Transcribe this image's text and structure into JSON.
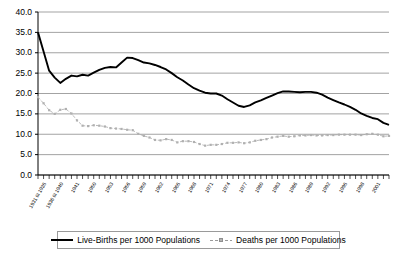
{
  "chart_data": {
    "type": "line",
    "title": "",
    "xlabel": "",
    "ylabel": "",
    "ylim": [
      0.0,
      40.0
    ],
    "ytick_labels": [
      "0.0",
      "5.0",
      "10.0",
      "15.0",
      "20.0",
      "25.0",
      "30.0",
      "35.0",
      "40.0"
    ],
    "ytick_values": [
      0,
      5,
      10,
      15,
      20,
      25,
      30,
      35,
      40
    ],
    "grid": true,
    "legend_position": "bottom",
    "categories": [
      "1931 til 1935",
      "1936 til 1940",
      "1941",
      "1942",
      "1943",
      "1944",
      "1945",
      "1946",
      "1947",
      "1948",
      "1949",
      "1950",
      "1951",
      "1952",
      "1953",
      "1954",
      "1955",
      "1956",
      "1957",
      "1958",
      "1959",
      "1960",
      "1961",
      "1962",
      "1963",
      "1964",
      "1965",
      "1966",
      "1967",
      "1968",
      "1969",
      "1970",
      "1971",
      "1972",
      "1973",
      "1974",
      "1975",
      "1976",
      "1977",
      "1978",
      "1979",
      "1980",
      "1981",
      "1982",
      "1983",
      "1984",
      "1985",
      "1986",
      "1987",
      "1988",
      "1989",
      "1990",
      "1991",
      "1992",
      "1993",
      "1994",
      "1995",
      "1996",
      "1997",
      "1998",
      "1999",
      "2000",
      "2001",
      "2002"
    ],
    "xtick_labels_shown": [
      "1931 til 1935",
      "1936 til 1940",
      "1941",
      "1950",
      "1953",
      "1956",
      "1959",
      "1962",
      "1965",
      "1968",
      "1971",
      "1974",
      "1977",
      "1980",
      "1983",
      "1986",
      "1989",
      "1992",
      "1995",
      "1998",
      "2001"
    ],
    "series": [
      {
        "name": "Live-Births per 1000 Populations",
        "color": "#000000",
        "style": "solid",
        "values": [
          35.0,
          30.3,
          25.6,
          23.9,
          22.6,
          23.6,
          24.4,
          24.2,
          24.6,
          24.4,
          25.1,
          25.8,
          26.3,
          26.5,
          26.4,
          27.6,
          28.8,
          28.7,
          28.2,
          27.6,
          27.4,
          27.0,
          26.5,
          25.9,
          25.0,
          24.0,
          23.2,
          22.2,
          21.3,
          20.7,
          20.2,
          20.0,
          20.0,
          19.5,
          18.6,
          17.8,
          17.0,
          16.7,
          17.1,
          17.8,
          18.3,
          18.9,
          19.5,
          20.1,
          20.5,
          20.5,
          20.4,
          20.3,
          20.4,
          20.4,
          20.2,
          19.7,
          19.0,
          18.4,
          17.8,
          17.3,
          16.7,
          16.0,
          15.1,
          14.5,
          14.0,
          13.7,
          12.8,
          12.3
        ]
      },
      {
        "name": "Deaths per 1000 Populations",
        "color": "#a8a8a8",
        "style": "dotted",
        "values": [
          19.1,
          17.6,
          15.9,
          15.0,
          16.0,
          16.2,
          15.1,
          13.4,
          12.1,
          12.0,
          12.2,
          12.1,
          11.9,
          11.5,
          11.4,
          11.3,
          11.1,
          11.0,
          10.1,
          9.6,
          9.2,
          8.6,
          8.5,
          8.8,
          8.6,
          8.0,
          8.3,
          8.3,
          8.1,
          7.6,
          7.2,
          7.4,
          7.4,
          7.6,
          7.9,
          7.9,
          8.0,
          7.8,
          8.0,
          8.4,
          8.6,
          8.8,
          9.2,
          9.4,
          9.6,
          9.4,
          9.5,
          9.7,
          9.7,
          9.8,
          9.7,
          9.7,
          9.8,
          9.8,
          9.9,
          9.9,
          9.9,
          9.9,
          9.8,
          10.0,
          10.1,
          9.9,
          9.5,
          9.6
        ]
      }
    ]
  },
  "legend": {
    "items": [
      {
        "label": "Live-Births per 1000 Populations"
      },
      {
        "label": "Deaths per 1000 Populations"
      }
    ]
  }
}
